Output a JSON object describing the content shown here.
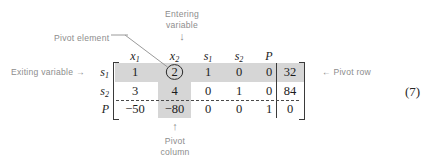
{
  "figure": {
    "equation_number": "(7)",
    "background_color": "#ffffff",
    "shade_color": "#d6d6d6",
    "annotation_color": "#8d8d8d",
    "text_color": "#1c1c1c"
  },
  "annotations": {
    "entering_variable": {
      "line1": "Entering",
      "line2": "variable",
      "arrow": "↓"
    },
    "pivot_element": "Pivot element",
    "exiting_variable": "Exiting variable  →",
    "pivot_row": "← Pivot row",
    "pivot_column": {
      "arrow": "↑",
      "line1": "Pivot",
      "line2": "column"
    }
  },
  "tableau": {
    "column_headers": [
      "x",
      "x",
      "s",
      "s",
      "P"
    ],
    "column_header_subs": [
      "1",
      "2",
      "1",
      "2",
      ""
    ],
    "row_labels": [
      "s",
      "s",
      "P"
    ],
    "row_label_subs": [
      "1",
      "2",
      ""
    ],
    "rows": [
      {
        "label": "s",
        "sub": "1",
        "cells": [
          "1",
          "2",
          "1",
          "0",
          "0"
        ],
        "rhs": "32"
      },
      {
        "label": "s",
        "sub": "2",
        "cells": [
          "3",
          "4",
          "0",
          "1",
          "0"
        ],
        "rhs": "84"
      },
      {
        "label": "P",
        "sub": "",
        "cells": [
          "−50",
          "−80",
          "0",
          "0",
          "1"
        ],
        "rhs": "0"
      }
    ],
    "pivot_element_value": "2",
    "pivot_row_index": 0,
    "pivot_column_index": 1
  }
}
